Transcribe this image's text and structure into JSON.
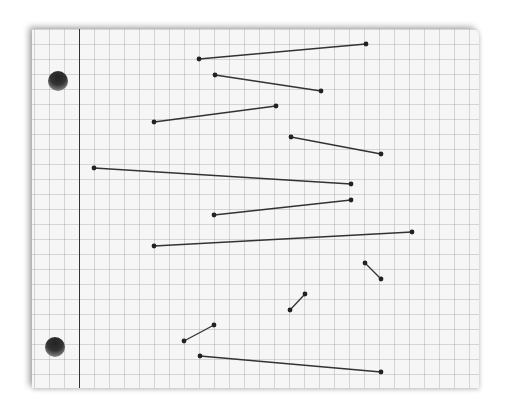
{
  "paper": {
    "background": "#f6f6f6",
    "grid_spacing_px": 15,
    "margin_line_color": "#333333",
    "holes": [
      {
        "cx": 58,
        "cy": 81
      },
      {
        "cx": 55,
        "cy": 347
      }
    ]
  },
  "segments": {
    "color": "#333333",
    "items": [
      {
        "x1": 199,
        "y1": 59,
        "x2": 366,
        "y2": 44
      },
      {
        "x1": 215,
        "y1": 75,
        "x2": 321,
        "y2": 91
      },
      {
        "x1": 154,
        "y1": 122,
        "x2": 276,
        "y2": 106
      },
      {
        "x1": 291,
        "y1": 137,
        "x2": 381,
        "y2": 154
      },
      {
        "x1": 94,
        "y1": 168,
        "x2": 351,
        "y2": 184
      },
      {
        "x1": 214,
        "y1": 215,
        "x2": 351,
        "y2": 200
      },
      {
        "x1": 154,
        "y1": 246,
        "x2": 412,
        "y2": 232
      },
      {
        "x1": 365,
        "y1": 263,
        "x2": 381,
        "y2": 279
      },
      {
        "x1": 290,
        "y1": 310,
        "x2": 305,
        "y2": 294
      },
      {
        "x1": 184,
        "y1": 341,
        "x2": 214,
        "y2": 325
      },
      {
        "x1": 200,
        "y1": 356,
        "x2": 381,
        "y2": 372
      }
    ]
  }
}
